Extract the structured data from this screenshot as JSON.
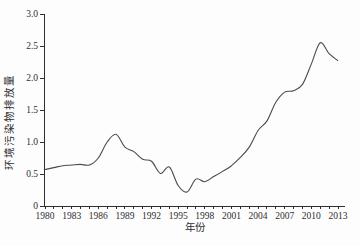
{
  "figure": {
    "background": "#fdfdfd",
    "line_color": "#4a4a4a",
    "axis_color": "#2e2e2e"
  },
  "chart_data": {
    "type": "line",
    "title": "",
    "xlabel": "年份",
    "ylabel": "环境污染物排放量",
    "x": [
      1980,
      1981,
      1982,
      1983,
      1984,
      1985,
      1986,
      1987,
      1988,
      1989,
      1990,
      1991,
      1992,
      1993,
      1994,
      1995,
      1996,
      1997,
      1998,
      1999,
      2000,
      2001,
      2002,
      2003,
      2004,
      2005,
      2006,
      2007,
      2008,
      2009,
      2010,
      2011,
      2012,
      2013
    ],
    "values": [
      0.57,
      0.6,
      0.63,
      0.64,
      0.65,
      0.64,
      0.75,
      1.0,
      1.12,
      0.92,
      0.85,
      0.73,
      0.7,
      0.51,
      0.61,
      0.32,
      0.22,
      0.42,
      0.38,
      0.46,
      0.54,
      0.63,
      0.76,
      0.92,
      1.18,
      1.33,
      1.62,
      1.78,
      1.8,
      1.9,
      2.22,
      2.55,
      2.38,
      2.27
    ],
    "xticks_labeled": [
      1980,
      1983,
      1986,
      1989,
      1992,
      1995,
      1998,
      2001,
      2004,
      2007,
      2010,
      2013
    ],
    "yticks": [
      0,
      0.5,
      1.0,
      1.5,
      2.0,
      2.5,
      3.0
    ],
    "ytick_labels": [
      "0",
      "0.5",
      "1.0",
      "1.5",
      "2.0",
      "2.5",
      "3.0"
    ],
    "xlim": [
      1980,
      2013
    ],
    "ylim": [
      0,
      3.0
    ],
    "grid": false,
    "legend": "none"
  }
}
